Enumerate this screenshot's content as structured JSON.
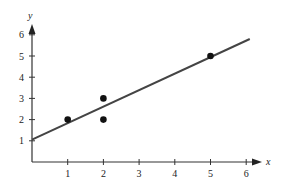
{
  "chart_data": {
    "type": "scatter",
    "title": "",
    "xlabel": "x",
    "ylabel": "y",
    "xlim": [
      0,
      6
    ],
    "ylim": [
      0,
      6
    ],
    "grid": false,
    "x_ticks": [
      1,
      2,
      3,
      4,
      5,
      6
    ],
    "y_ticks": [
      1,
      2,
      3,
      4,
      5,
      6
    ],
    "points": [
      {
        "x": 1,
        "y": 2
      },
      {
        "x": 2,
        "y": 3
      },
      {
        "x": 2,
        "y": 2
      },
      {
        "x": 5,
        "y": 5
      }
    ],
    "fit_line": {
      "intercept": 1.056,
      "slope": 0.778,
      "x_start": 0,
      "x_end": 6.1
    },
    "colors": {
      "axis": "#333333",
      "line": "#444444",
      "point": "#111111"
    }
  },
  "axes": {
    "x_label": "x",
    "y_label": "y",
    "x_tick_labels": [
      "1",
      "2",
      "3",
      "4",
      "5",
      "6"
    ],
    "y_tick_labels": [
      "1",
      "2",
      "3",
      "4",
      "5",
      "6"
    ]
  }
}
